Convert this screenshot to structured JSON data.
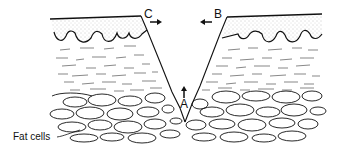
{
  "diagram": {
    "type": "cross-section",
    "labels": {
      "a": "A",
      "b": "B",
      "c": "C",
      "fat_cells": "Fat cells"
    },
    "arrows": [
      {
        "label": "A",
        "direction": "up"
      },
      {
        "label": "B",
        "direction": "left"
      },
      {
        "label": "C",
        "direction": "right"
      }
    ],
    "colors": {
      "ink": "#111111",
      "background": "#ffffff",
      "stipple": "#9a9a9a"
    }
  }
}
